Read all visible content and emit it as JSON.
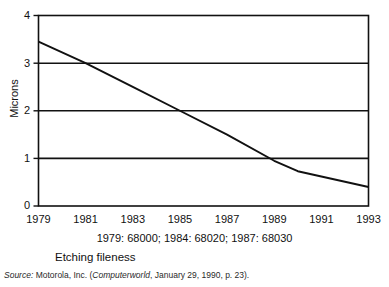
{
  "figure": {
    "caption_label": "Etching fileness",
    "annotation": "1979: 68000; 1984: 68020; 1987: 68030",
    "source": {
      "prefix": "Source:",
      "org": " Motorola, Inc. (",
      "publication": "Computerworld",
      "rest": ", January 29, 1990, p. 23)."
    }
  },
  "chart_data": {
    "type": "line",
    "title": "",
    "subtitle": "",
    "xlabel": "",
    "ylabel": "Microns",
    "annotation": "1979: 68000; 1984: 68020; 1987: 68030",
    "grid": "horizontal",
    "legend": "none",
    "xlim": [
      1979,
      1993
    ],
    "ylim": [
      0,
      4
    ],
    "xticks": [
      "1979",
      "1981",
      "1983",
      "1985",
      "1987",
      "1989",
      "1991",
      "1993"
    ],
    "xtick_values": [
      1979,
      1981,
      1983,
      1985,
      1987,
      1989,
      1991,
      1993
    ],
    "yticks": [
      "0",
      "1",
      "2",
      "3",
      "4"
    ],
    "ytick_values": [
      0,
      1,
      2,
      3,
      4
    ],
    "series": [
      {
        "name": "Etching fineness",
        "color": "#111111",
        "x": [
          1979,
          1981,
          1983,
          1985,
          1987,
          1989,
          1990,
          1991,
          1993
        ],
        "values": [
          3.45,
          3.0,
          2.5,
          2.0,
          1.5,
          0.95,
          0.73,
          0.62,
          0.4
        ]
      }
    ]
  },
  "colors": {
    "axis": "#111111",
    "grid": "#111111",
    "line": "#111111",
    "background": "#ffffff"
  }
}
